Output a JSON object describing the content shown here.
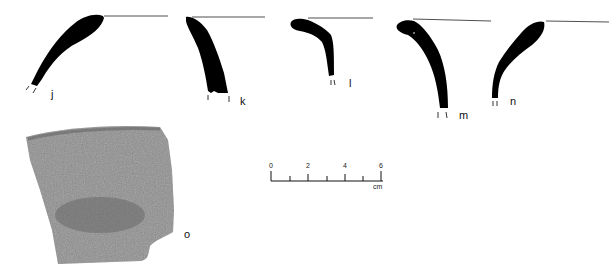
{
  "figure": {
    "profiles": [
      {
        "id": "j",
        "label": "j"
      },
      {
        "id": "k",
        "label": "k"
      },
      {
        "id": "l",
        "label": "l"
      },
      {
        "id": "m",
        "label": "m"
      },
      {
        "id": "n",
        "label": "n"
      }
    ],
    "photo": {
      "id": "o",
      "label": "o"
    },
    "scale": {
      "ticks": [
        "0",
        "2",
        "4",
        "6"
      ],
      "unit": "cm"
    },
    "colors": {
      "ink": "#000000",
      "sherd": "#8e8e8e",
      "background": "#ffffff"
    }
  }
}
